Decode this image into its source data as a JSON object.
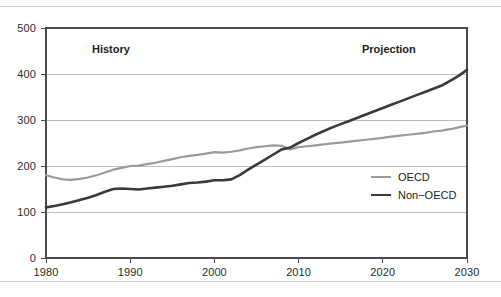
{
  "chart_data": {
    "type": "line",
    "title": "",
    "xlabel": "",
    "ylabel": "",
    "xlim": [
      1980,
      2030
    ],
    "ylim": [
      0,
      500
    ],
    "grid": true,
    "legend_position": "right-inside",
    "xticks": [
      "1980",
      "1990",
      "2000",
      "2010",
      "2020",
      "2030"
    ],
    "yticks": [
      "0",
      "100",
      "200",
      "300",
      "400",
      "500"
    ],
    "annotations": [
      {
        "text": "History",
        "x": 1992,
        "y": 455
      },
      {
        "text": "Projection",
        "x": 2017,
        "y": 455
      }
    ],
    "x": [
      1980,
      1981,
      1982,
      1983,
      1984,
      1985,
      1986,
      1987,
      1988,
      1989,
      1990,
      1991,
      1992,
      1993,
      1994,
      1995,
      1996,
      1997,
      1998,
      1999,
      2000,
      2001,
      2002,
      2003,
      2004,
      2005,
      2006,
      2007,
      2008,
      2009,
      2010,
      2011,
      2012,
      2013,
      2014,
      2015,
      2016,
      2017,
      2018,
      2019,
      2020,
      2021,
      2022,
      2023,
      2024,
      2025,
      2026,
      2027,
      2028,
      2029,
      2030
    ],
    "series": [
      {
        "name": "OECD",
        "color": "#9a9a9a",
        "width": 2.2,
        "values": [
          180,
          175,
          171,
          170,
          172,
          175,
          180,
          186,
          192,
          196,
          200,
          201,
          204,
          207,
          211,
          215,
          219,
          222,
          224,
          227,
          230,
          229,
          231,
          234,
          238,
          241,
          243,
          245,
          244,
          236,
          241,
          243,
          245,
          247,
          249,
          251,
          253,
          255,
          257,
          259,
          261,
          264,
          266,
          268,
          270,
          272,
          275,
          277,
          280,
          284,
          288
        ]
      },
      {
        "name": "Non-OECD",
        "color": "#3a3a3a",
        "width": 2.6,
        "values": [
          110,
          113,
          117,
          121,
          126,
          131,
          137,
          144,
          150,
          151,
          150,
          149,
          151,
          153,
          155,
          157,
          160,
          163,
          164,
          166,
          169,
          169,
          171,
          180,
          192,
          203,
          214,
          225,
          236,
          240,
          250,
          259,
          268,
          276,
          284,
          291,
          298,
          305,
          312,
          319,
          326,
          333,
          340,
          347,
          354,
          361,
          368,
          375,
          385,
          396,
          409
        ]
      }
    ]
  },
  "legend": {
    "items": [
      {
        "label": "OECD"
      },
      {
        "label": "Non−OECD"
      }
    ]
  },
  "axes": {
    "x_tick_labels": [
      "1980",
      "1990",
      "2000",
      "2010",
      "2020",
      "2030"
    ],
    "y_tick_labels": [
      "0",
      "100",
      "200",
      "300",
      "400",
      "500"
    ]
  }
}
